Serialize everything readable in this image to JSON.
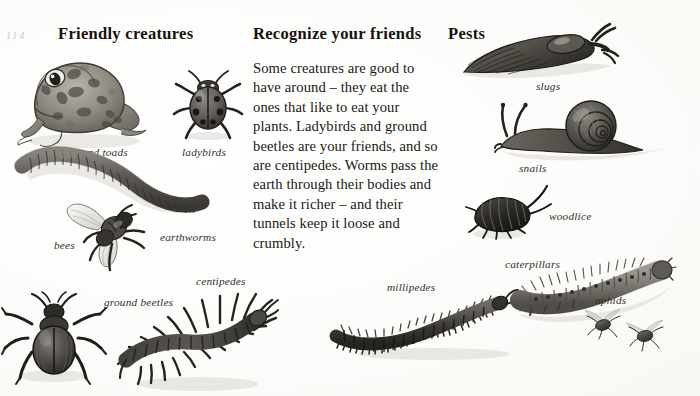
{
  "page": {
    "folio": "114",
    "background_color": "#fdfdfb",
    "ink_color": "#1a1a1a"
  },
  "columns": {
    "left": {
      "heading": "Friendly creatures",
      "figures": [
        {
          "id": "frog",
          "label": "frogs and toads",
          "icon": "frog-illustration"
        },
        {
          "id": "ladybird",
          "label": "ladybirds",
          "icon": "ladybird-illustration"
        },
        {
          "id": "earthworm",
          "label": "earthworms",
          "icon": "earthworm-illustration"
        },
        {
          "id": "bee",
          "label": "bees",
          "icon": "bee-illustration"
        },
        {
          "id": "ground-beetle",
          "label": "ground beetles",
          "icon": "ground-beetle-illustration"
        },
        {
          "id": "centipede",
          "label": "centipedes",
          "icon": "centipede-illustration"
        }
      ]
    },
    "middle": {
      "heading": "Recognize your friends",
      "paragraph": "Some creatures are good to have around – they eat the ones that like to eat your plants. Ladybirds and ground beetles are your friends, and so are centipedes. Worms pass the earth through their bodies and make it richer – and their tunnels keep it loose and crumbly.",
      "figures": [
        {
          "id": "millipede",
          "label": "millipedes",
          "icon": "millipede-illustration"
        }
      ]
    },
    "right": {
      "heading": "Pests",
      "figures": [
        {
          "id": "slug",
          "label": "slugs",
          "icon": "slug-illustration"
        },
        {
          "id": "snail",
          "label": "snails",
          "icon": "snail-illustration"
        },
        {
          "id": "woodlouse",
          "label": "woodlice",
          "icon": "woodlouse-illustration"
        },
        {
          "id": "caterpillar",
          "label": "caterpillars",
          "icon": "caterpillar-illustration"
        },
        {
          "id": "aphid",
          "label": "aphids",
          "icon": "aphid-illustration"
        }
      ]
    }
  }
}
